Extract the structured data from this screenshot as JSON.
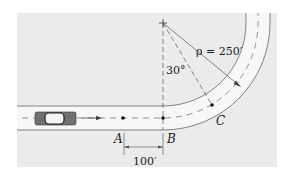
{
  "figure": {
    "labels": {
      "point_a": "A",
      "point_b": "B",
      "point_c": "C",
      "radius": "ρ = 250′",
      "angle": "30°",
      "distance": "100′"
    },
    "colors": {
      "background": "#ebebeb",
      "road": "#f7f7f7",
      "line": "#555555",
      "text": "#1a1a1a",
      "car_body": "#707070"
    },
    "icons": [
      "car-icon",
      "arrow-right-icon",
      "center-cross-icon"
    ]
  }
}
